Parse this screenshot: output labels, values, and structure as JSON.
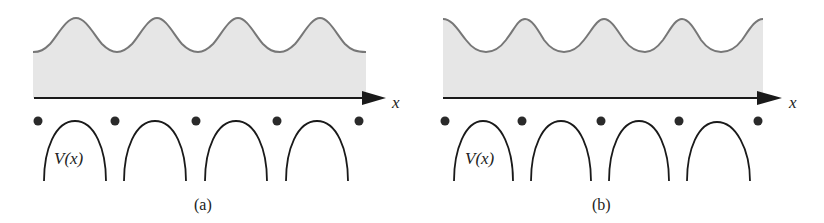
{
  "figure": {
    "colors": {
      "fill": "#e6e6e6",
      "wave_stroke": "#777777",
      "axis": "#1a1a1a",
      "ion": "#2a2a2a",
      "arch": "#1a1a1a",
      "text": "#222222"
    },
    "panels": [
      {
        "id": "a",
        "caption": "(a)",
        "axis_label": "x",
        "potential_label": "V(x)",
        "description": "Wave peaks located between ions (over potential barriers)"
      },
      {
        "id": "b",
        "caption": "(b)",
        "axis_label": "x",
        "potential_label": "V(x)",
        "description": "Wave peaks located at ion positions (shifted by half period)"
      }
    ]
  }
}
